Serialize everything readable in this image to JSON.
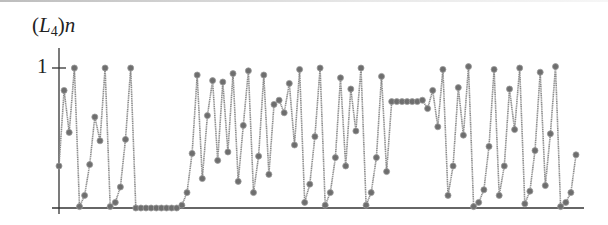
{
  "chart_data": {
    "type": "line",
    "title": "(L4)n",
    "title_parts": {
      "open": "(",
      "var": "L",
      "sub": "4",
      "close": ")",
      "index": "n"
    },
    "xlabel": "",
    "ylabel": "(L4)n",
    "ylim": [
      0,
      1
    ],
    "yticks": [
      {
        "value": 1,
        "label": "1"
      }
    ],
    "xticks": [],
    "grid": false,
    "legend": null,
    "markers": true,
    "series": [
      {
        "name": "(L4)n",
        "color": "#8a8a8a",
        "marker_color": "#6e6e6e",
        "values": [
          0.3,
          0.84,
          0.54,
          1.0,
          0.01,
          0.09,
          0.31,
          0.65,
          0.48,
          1.0,
          0.01,
          0.04,
          0.15,
          0.49,
          1.0,
          0.0,
          0.0,
          0.0,
          0.0,
          0.0,
          0.0,
          0.0,
          0.0,
          0.0,
          0.02,
          0.11,
          0.39,
          0.95,
          0.21,
          0.66,
          0.91,
          0.34,
          0.9,
          0.4,
          0.96,
          0.19,
          0.59,
          0.98,
          0.11,
          0.37,
          0.95,
          0.24,
          0.74,
          0.77,
          0.68,
          0.89,
          0.45,
          0.99,
          0.04,
          0.17,
          0.51,
          1.0,
          0.02,
          0.11,
          0.36,
          0.93,
          0.3,
          0.85,
          0.55,
          1.0,
          0.02,
          0.11,
          0.36,
          0.94,
          0.26,
          0.76,
          0.76,
          0.76,
          0.76,
          0.76,
          0.76,
          0.77,
          0.71,
          0.84,
          0.58,
          0.99,
          0.09,
          0.3,
          0.86,
          0.52,
          1.01,
          0.01,
          0.04,
          0.13,
          0.44,
          0.99,
          0.09,
          0.3,
          0.85,
          0.56,
          1.0,
          0.03,
          0.12,
          0.41,
          0.97,
          0.16,
          0.53,
          1.01,
          0.01,
          0.04,
          0.11,
          0.38
        ]
      }
    ]
  }
}
